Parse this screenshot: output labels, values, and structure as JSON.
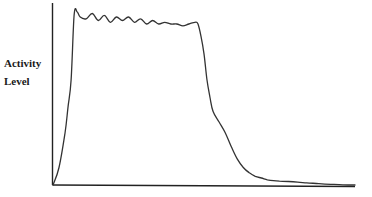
{
  "chart_data": {
    "type": "line",
    "title": "",
    "xlabel": "",
    "ylabel": "Activity Level",
    "ylabel_lines": [
      "Activity",
      "Level"
    ],
    "grid": false,
    "legend": null,
    "x_ticks": [],
    "y_ticks": [],
    "xlim": [
      0,
      100
    ],
    "ylim": [
      0,
      100
    ],
    "line_color": "#333333",
    "axis_color": "#222222",
    "series": [
      {
        "name": "Activity",
        "x": [
          0,
          2,
          4,
          5,
          6,
          7,
          8,
          9,
          11,
          13,
          15,
          17,
          19,
          21,
          23,
          25,
          27,
          29,
          31,
          33,
          35,
          37,
          39,
          41,
          43,
          45,
          47,
          48,
          49,
          50,
          51,
          52,
          53,
          55,
          57,
          59,
          61,
          63,
          65,
          67,
          69,
          71,
          73,
          75,
          78,
          81,
          84,
          88,
          92,
          96,
          100
        ],
        "values": [
          0,
          10,
          30,
          45,
          60,
          97,
          99,
          96,
          95,
          98,
          94,
          97,
          93,
          96,
          94,
          96,
          93,
          95,
          92,
          94,
          92,
          93,
          92,
          92,
          91,
          92,
          93,
          92,
          85,
          75,
          60,
          50,
          42,
          36,
          30,
          22,
          15,
          10,
          7,
          5,
          4,
          3,
          2.5,
          2.2,
          2,
          1.6,
          1.2,
          0.8,
          0.4,
          0.1,
          0
        ]
      }
    ]
  }
}
